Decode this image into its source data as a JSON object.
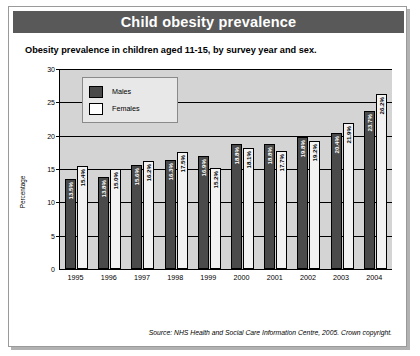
{
  "header": {
    "title": "Child obesity prevalence"
  },
  "subtitle": "Obesity prevalence in children aged 11-15, by survey year and sex.",
  "footer": {
    "source": "Source: NHS Health and Social Care Information Centre, 2005. Crown copyright."
  },
  "colors": {
    "title_bar": "#595959",
    "title_text": "#ffffff",
    "plot_background": "#d4d4d4",
    "males": "#4a4a4a",
    "females": "#f2f2f2",
    "axis": "#000000",
    "legend_background": "#e8e8e8",
    "page_background": "#ffffff"
  },
  "chart_data": {
    "type": "bar",
    "title": "Child obesity prevalence",
    "subtitle": "Obesity prevalence in children aged 11-15, by survey year and sex.",
    "xlabel": "",
    "ylabel": "Percentage",
    "ylim": [
      0,
      30
    ],
    "yticks": [
      0,
      5,
      10,
      15,
      20,
      25,
      30
    ],
    "ytick_labels": [
      "0",
      "5",
      "10",
      "15",
      "20",
      "25",
      "30"
    ],
    "grid": true,
    "legend_position": "upper-left-inside",
    "categories": [
      "1995",
      "1996",
      "1997",
      "1998",
      "1999",
      "2000",
      "2001",
      "2002",
      "2003",
      "2004"
    ],
    "series": [
      {
        "name": "Males",
        "color": "#4a4a4a",
        "values": [
          13.5,
          13.8,
          15.6,
          16.3,
          16.9,
          18.8,
          18.8,
          19.8,
          20.4,
          23.7
        ],
        "data_labels": [
          "13.5%",
          "13.8%",
          "15.6%",
          "16.3%",
          "16.9%",
          "18.8%",
          "18.8%",
          "19.8%",
          "20.4%",
          "23.7%"
        ]
      },
      {
        "name": "Females",
        "color": "#f2f2f2",
        "values": [
          15.4,
          15.0,
          16.2,
          17.5,
          15.2,
          18.1,
          17.7,
          19.2,
          21.9,
          26.2
        ],
        "data_labels": [
          "15.4%",
          "15.0%",
          "16.2%",
          "17.5%",
          "15.2%",
          "18.1%",
          "17.7%",
          "19.2%",
          "21.9%",
          "26.2%"
        ]
      }
    ]
  }
}
